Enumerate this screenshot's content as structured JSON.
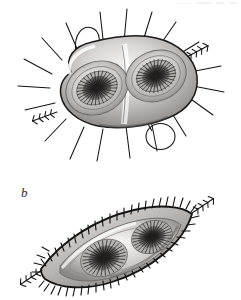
{
  "plate": {
    "type": "scientific-illustration-plate",
    "medium": "graphite-and-wash-drawing",
    "background_color": "#ffffff",
    "ink_color": "#1a1a1a",
    "width_px": 241,
    "height_px": 300,
    "panel_count": 2
  },
  "labels": {
    "panel_b": "b"
  },
  "panels": [
    {
      "id": "panel-a",
      "label": "",
      "position": "top",
      "subject": "spiny ovoid microfossil, oblique view, two concentric depressions",
      "outline_shape": "rounded-lobed-ovoid",
      "tilt_degrees": -28,
      "bounds": {
        "x": 42,
        "y": 24,
        "width": 160,
        "height": 120
      },
      "body_fill_light": "#f2f0ee",
      "body_fill_mid": "#b9b6b3",
      "body_fill_dark": "#6d6a68",
      "features": {
        "aperture_count": 2,
        "aperture_description": "radiating dark striate burst within recessed concentric rim",
        "rim_ring_count": 3,
        "plain_spine_count": 14,
        "barbed_spine_count": 2,
        "loop_count": 2,
        "loop_description": "open wire-like loops projecting from upper-left and lower-right margins",
        "groove_description": "diagonal ridge separating the two apertural lobes"
      }
    },
    {
      "id": "panel-b",
      "label": "b",
      "position": "bottom",
      "subject": "spiny lens-shaped microfossil, flattened view, two depressions",
      "outline_shape": "lens-spindle",
      "tilt_degrees": -20,
      "bounds": {
        "x": 26,
        "y": 200,
        "width": 190,
        "height": 96
      },
      "body_fill_light": "#efeeec",
      "body_fill_mid": "#b2afac",
      "body_fill_dark": "#5f5c5a",
      "features": {
        "aperture_count": 2,
        "aperture_description": "radiating dark striate burst, lower-left one larger",
        "rim_ring_count": 2,
        "comb_spine_count": 64,
        "comb_spine_description": "dense short barbs set perpendicular along the entire margin",
        "barbed_tip_count": 2,
        "barbed_tip_description": "elongated forked projections at both pointed poles"
      }
    }
  ],
  "artifacts": {
    "scan_smudge_present": true,
    "scan_smudge_location": "top-right margin"
  }
}
